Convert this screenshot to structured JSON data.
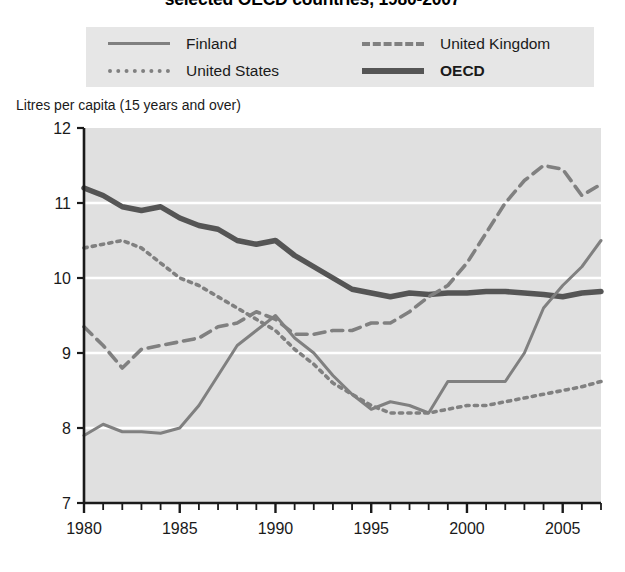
{
  "title": "selected OECD countries, 1980-2007",
  "legend": {
    "position": "top",
    "items": [
      {
        "label": "Finland",
        "style": "solid-thin",
        "icon": "line-solid-thin-icon",
        "color": "#808080",
        "bold": false
      },
      {
        "label": "United Kingdom",
        "style": "dashed",
        "icon": "line-dashed-icon",
        "color": "#808080",
        "bold": false
      },
      {
        "label": "United States",
        "style": "dotted",
        "icon": "line-dotted-icon",
        "color": "#808080",
        "bold": false
      },
      {
        "label": "OECD",
        "style": "solid-thick",
        "icon": "line-solid-thick-icon",
        "color": "#555555",
        "bold": true
      }
    ]
  },
  "axis": {
    "y_caption": "Litres per capita (15 years and over)",
    "y_ticks": [
      "12",
      "11",
      "10",
      "9",
      "8",
      "7"
    ],
    "x_ticks": [
      "1980",
      "1985",
      "1990",
      "1995",
      "2000",
      "2005"
    ]
  },
  "colors": {
    "plot_background": "#e0e0e0",
    "legend_background": "#e6e6e6",
    "gridline": "#ffffff",
    "axis": "#1a1a1a",
    "series_light": "#808080",
    "series_dark": "#555555",
    "page_background": "#ffffff"
  },
  "chart_data": {
    "type": "line",
    "title": "selected OECD countries, 1980-2007",
    "xlabel": "",
    "ylabel": "Litres per capita (15 years and over)",
    "xlim": [
      1980,
      2007
    ],
    "ylim": [
      7,
      12
    ],
    "grid": true,
    "x_tick_values": [
      1980,
      1985,
      1990,
      1995,
      2000,
      2005
    ],
    "y_tick_values": [
      7,
      8,
      9,
      10,
      11,
      12
    ],
    "x_minor_tick_interval": 1,
    "legend_position": "top",
    "x": [
      1980,
      1981,
      1982,
      1983,
      1984,
      1985,
      1986,
      1987,
      1988,
      1989,
      1990,
      1991,
      1992,
      1993,
      1994,
      1995,
      1996,
      1997,
      1998,
      1999,
      2000,
      2001,
      2002,
      2003,
      2004,
      2005,
      2006,
      2007
    ],
    "series": [
      {
        "name": "OECD",
        "style": "solid-thick",
        "color": "#555555",
        "values": [
          11.2,
          11.1,
          10.95,
          10.9,
          10.95,
          10.8,
          10.7,
          10.65,
          10.5,
          10.45,
          10.5,
          10.3,
          10.15,
          10.0,
          9.85,
          9.8,
          9.75,
          9.8,
          9.78,
          9.8,
          9.8,
          9.82,
          9.82,
          9.8,
          9.78,
          9.75,
          9.8,
          9.82
        ]
      },
      {
        "name": "United States",
        "style": "dotted",
        "color": "#808080",
        "values": [
          10.4,
          10.45,
          10.5,
          10.4,
          10.2,
          10.0,
          9.9,
          9.75,
          9.6,
          9.45,
          9.3,
          9.05,
          8.85,
          8.6,
          8.45,
          8.3,
          8.2,
          8.2,
          8.2,
          8.25,
          8.3,
          8.3,
          8.35,
          8.4,
          8.45,
          8.5,
          8.55,
          8.62
        ]
      },
      {
        "name": "United Kingdom",
        "style": "dashed",
        "color": "#808080",
        "values": [
          9.35,
          9.1,
          8.8,
          9.05,
          9.1,
          9.15,
          9.2,
          9.35,
          9.4,
          9.55,
          9.45,
          9.25,
          9.25,
          9.3,
          9.3,
          9.4,
          9.4,
          9.55,
          9.75,
          9.9,
          10.2,
          10.6,
          11.0,
          11.3,
          11.5,
          11.45,
          11.1,
          11.25
        ]
      },
      {
        "name": "Finland",
        "style": "solid-thin",
        "color": "#808080",
        "values": [
          7.9,
          8.05,
          7.95,
          7.95,
          7.93,
          8.0,
          8.3,
          8.7,
          9.1,
          9.3,
          9.5,
          9.2,
          9.0,
          8.7,
          8.45,
          8.25,
          8.35,
          8.3,
          8.2,
          8.62,
          8.62,
          8.62,
          8.62,
          9.0,
          9.6,
          9.9,
          10.15,
          10.5
        ]
      }
    ]
  }
}
